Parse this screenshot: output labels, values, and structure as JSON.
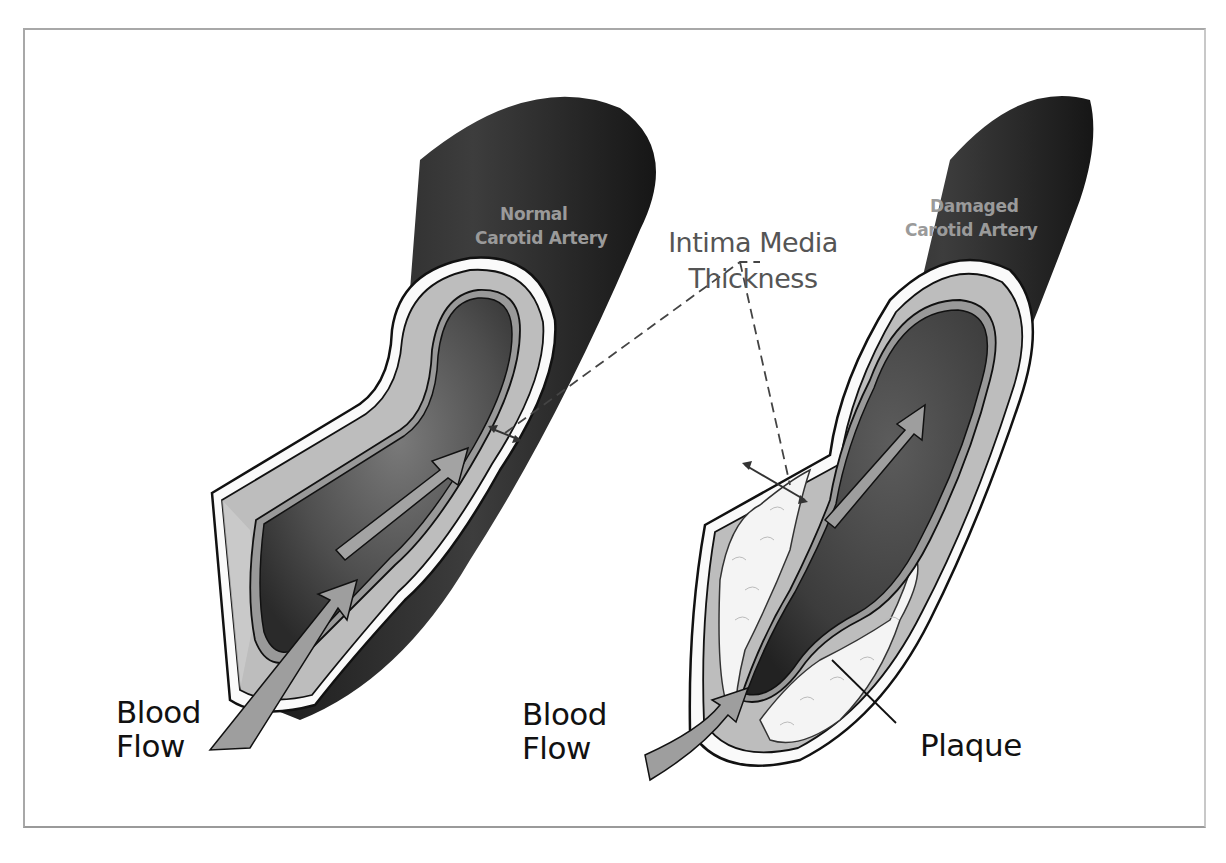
{
  "diagram": {
    "left_vessel": {
      "title_line1": "Normal",
      "title_line2": "Carotid Artery",
      "flow_label_line1": "Blood",
      "flow_label_line2": "Flow"
    },
    "right_vessel": {
      "title_line1": "Damaged",
      "title_line2": "Carotid Artery",
      "flow_label_line1": "Blood",
      "flow_label_line2": "Flow",
      "plaque_label": "Plaque"
    },
    "callout": {
      "line1": "Intima Media",
      "line2": "Thickness"
    },
    "colors": {
      "outer_wall": "#2b2b2b",
      "media_layer": "#bdbdbd",
      "lumen": "#5a5a5a",
      "arrow": "#9e9e9e",
      "plaque": "#f4f4f4",
      "frame_border": "#a8a8a8"
    }
  }
}
